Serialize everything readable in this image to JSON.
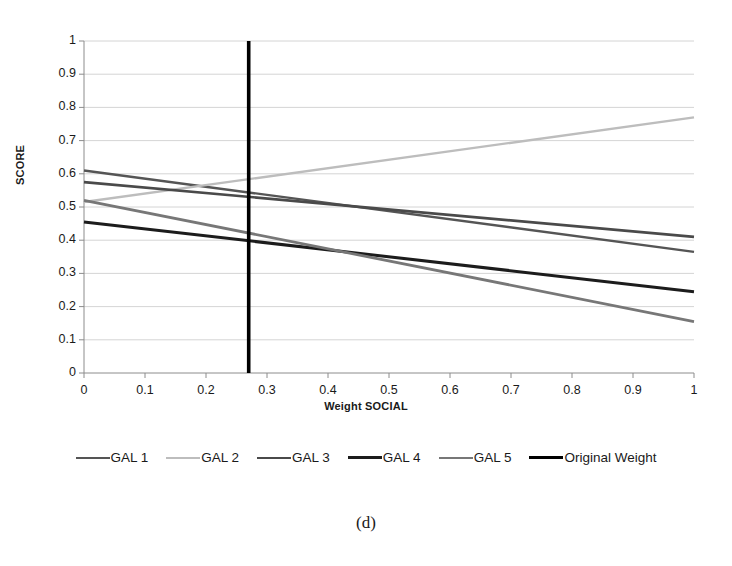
{
  "caption": "(d)",
  "chart_data": {
    "type": "line",
    "title": "",
    "xlabel": "Weight SOCIAL",
    "ylabel": "SCORE",
    "xlim": [
      0,
      1
    ],
    "ylim": [
      0,
      1
    ],
    "xticks": [
      "0",
      "0.1",
      "0.2",
      "0.3",
      "0.4",
      "0.5",
      "0.6",
      "0.7",
      "0.8",
      "0.9",
      "1"
    ],
    "xtick_values": [
      0,
      0.1,
      0.2,
      0.3,
      0.4,
      0.5,
      0.6,
      0.7,
      0.8,
      0.9,
      1
    ],
    "yticks": [
      "0",
      "0.1",
      "0.2",
      "0.3",
      "0.4",
      "0.5",
      "0.6",
      "0.7",
      "0.8",
      "0.9",
      "1"
    ],
    "ytick_values": [
      0,
      0.1,
      0.2,
      0.3,
      0.4,
      0.5,
      0.6,
      0.7,
      0.8,
      0.9,
      1
    ],
    "grid": "horizontal",
    "legend_position": "bottom",
    "x": [
      0,
      1
    ],
    "series": [
      {
        "name": "GAL 1",
        "values": [
          0.61,
          0.365
        ],
        "color": "#555555",
        "width": 2.4
      },
      {
        "name": "GAL 2",
        "values": [
          0.515,
          0.77
        ],
        "color": "#bdbdbd",
        "width": 2.4
      },
      {
        "name": "GAL 3",
        "values": [
          0.575,
          0.41
        ],
        "color": "#4a4a4a",
        "width": 2.6
      },
      {
        "name": "GAL 4",
        "values": [
          0.455,
          0.245
        ],
        "color": "#1c1c1c",
        "width": 3.0
      },
      {
        "name": "GAL 5",
        "values": [
          0.52,
          0.155
        ],
        "color": "#777777",
        "width": 2.8
      }
    ],
    "vertical_rules": [
      {
        "name": "Original Weight",
        "x": 0.27,
        "y_range": [
          0,
          1
        ],
        "color": "#000000",
        "width": 3.6
      }
    ],
    "annotations": []
  }
}
